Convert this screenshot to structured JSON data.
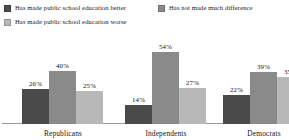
{
  "legend": {
    "items": [
      {
        "label": "Has made public school education better",
        "color": "#4a4a4a",
        "icon": "legend-swatch-icon"
      },
      {
        "label": "Has not made much difference",
        "color": "#8a8a8a",
        "icon": "legend-swatch-icon"
      },
      {
        "label": "Has made public school education worse",
        "color": "#b8b8b8",
        "icon": "legend-swatch-icon"
      }
    ]
  },
  "chart_data": {
    "type": "bar",
    "title": "",
    "subtitle": "",
    "xlabel": "",
    "ylabel": "",
    "ylim": [
      0,
      60
    ],
    "grid": false,
    "legend_position": "top",
    "value_labels": true,
    "value_suffix": "%",
    "categories": [
      "Republicans",
      "Independents",
      "Democrats"
    ],
    "series": [
      {
        "name": "Has made public school education better",
        "color": "#4a4a4a",
        "values": [
          26,
          40,
          22
        ],
        "labels": [
          "26%",
          "40%",
          "22%"
        ]
      },
      {
        "name": "Has not made much difference",
        "color": "#8a8a8a",
        "values": [
          40,
          54,
          39
        ],
        "labels": [
          "40%",
          "54%",
          "39%"
        ]
      },
      {
        "name": "Has made public school education worse",
        "color": "#b8b8b8",
        "values": [
          25,
          27,
          35
        ],
        "labels": [
          "25%",
          "27%",
          "35%"
        ]
      }
    ],
    "groups": [
      {
        "category": "Republicans",
        "bars": [
          {
            "series": "Has made public school education better",
            "value": 26,
            "label": "26%",
            "color": "#4a4a4a"
          },
          {
            "series": "Has not made much difference",
            "value": 40,
            "label": "40%",
            "color": "#8a8a8a"
          },
          {
            "series": "Has made public school education worse",
            "value": 25,
            "label": "25%",
            "color": "#b8b8b8"
          }
        ]
      },
      {
        "category": "Independents",
        "bars": [
          {
            "series": "Has made public school education better",
            "value": 14,
            "label": "14%",
            "color": "#4a4a4a"
          },
          {
            "series": "Has not made much difference",
            "value": 54,
            "label": "54%",
            "color": "#8a8a8a"
          },
          {
            "series": "Has made public school education worse",
            "value": 27,
            "label": "27%",
            "color": "#b8b8b8"
          }
        ]
      },
      {
        "category": "Democrats",
        "bars": [
          {
            "series": "Has made public school education better",
            "value": 22,
            "label": "22%",
            "color": "#4a4a4a"
          },
          {
            "series": "Has not made much difference",
            "value": 39,
            "label": "39%",
            "color": "#8a8a8a"
          },
          {
            "series": "Has made public school education worse",
            "value": 35,
            "label": "35%",
            "color": "#b8b8b8"
          }
        ]
      }
    ]
  },
  "axis": {
    "baseline_color": "#9a9a9a"
  }
}
